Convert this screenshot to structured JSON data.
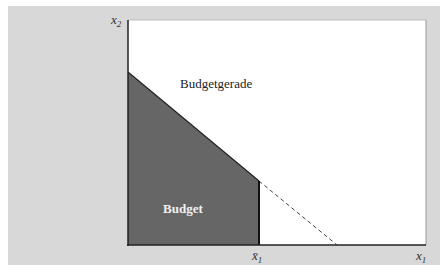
{
  "diagram": {
    "type": "budget-set",
    "axes": {
      "y_label": "x",
      "y_label_sub": "2",
      "x_label": "x",
      "x_label_sub": "1"
    },
    "x_bar_label": "x̄",
    "x_bar_sub": "1",
    "budget_line_label": "Budgetgerade",
    "budget_region_label": "Budget",
    "colors": {
      "background": "#d8d8d8",
      "plot_area": "#ffffff",
      "budget_fill": "#666666",
      "axis": "#222222",
      "budget_text": "#f0f0f0"
    }
  }
}
